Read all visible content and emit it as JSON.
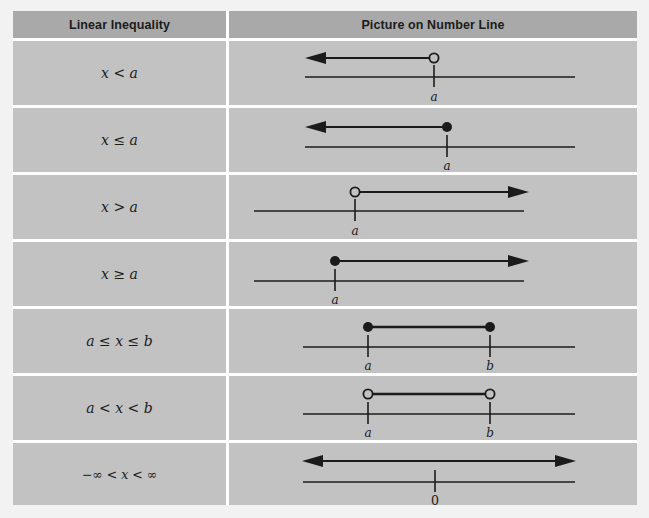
{
  "table": {
    "headers": {
      "left": "Linear Inequality",
      "right": "Picture on Number Line"
    },
    "colors": {
      "page_background": "#f2f2f2",
      "header_fill": "#a9a9a9",
      "cell_fill": "#c2c2c2",
      "grid_line": "#ffffff",
      "ink": "#1b1b1b"
    },
    "rows": [
      {
        "inequality": "x < a",
        "graph": {
          "type": "ray-left",
          "endpoint_style": "open",
          "endpoint_label": "a",
          "arrow_direction": "left",
          "tick_labels": [
            "a"
          ]
        }
      },
      {
        "inequality": "x ≤ a",
        "graph": {
          "type": "ray-left",
          "endpoint_style": "closed",
          "endpoint_label": "a",
          "arrow_direction": "left",
          "tick_labels": [
            "a"
          ]
        }
      },
      {
        "inequality": "x > a",
        "graph": {
          "type": "ray-right",
          "endpoint_style": "open",
          "endpoint_label": "a",
          "arrow_direction": "right",
          "tick_labels": [
            "a"
          ]
        }
      },
      {
        "inequality": "x ≥ a",
        "graph": {
          "type": "ray-right",
          "endpoint_style": "closed",
          "endpoint_label": "a",
          "arrow_direction": "right",
          "tick_labels": [
            "a"
          ]
        }
      },
      {
        "inequality": "a ≤ x ≤ b",
        "graph": {
          "type": "segment",
          "endpoint_style": "closed",
          "arrow_direction": "none",
          "tick_labels": [
            "a",
            "b"
          ]
        }
      },
      {
        "inequality": "a < x < b",
        "graph": {
          "type": "segment",
          "endpoint_style": "open",
          "arrow_direction": "none",
          "tick_labels": [
            "a",
            "b"
          ]
        }
      },
      {
        "inequality": "−∞ < x < ∞",
        "graph": {
          "type": "full-line",
          "endpoint_style": "none",
          "arrow_direction": "both",
          "tick_labels": [
            "0"
          ]
        }
      }
    ]
  }
}
